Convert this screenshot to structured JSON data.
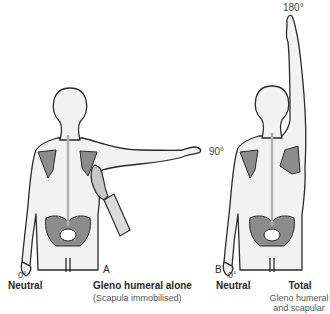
{
  "figure": {
    "panel_a": {
      "letter": "A",
      "start_angle": "0°",
      "start_label": "Neutral",
      "end_angle": "90°",
      "title": "Gleno humeral alone",
      "subtitle": "(Scapula immobilised)"
    },
    "panel_b": {
      "letter": "B",
      "start_angle": "0°",
      "start_label": "Neutral",
      "end_angle": "180°",
      "title": "Total",
      "subtitle_line1": "Gleno humeral",
      "subtitle_line2": "and scapular"
    },
    "colors": {
      "body_fill": "#f2f2f2",
      "outline": "#2a2a2a",
      "bone_fill": "#8c8c8c",
      "spine": "#b0b0b0"
    }
  }
}
